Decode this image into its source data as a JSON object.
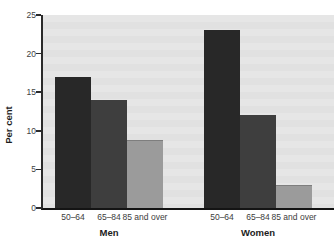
{
  "chart_data": {
    "type": "bar",
    "ylabel": "Per cent",
    "ylim": [
      0,
      25
    ],
    "yticks": [
      0,
      5,
      10,
      15,
      20,
      25
    ],
    "categories": [
      "50–64",
      "65–84",
      "85 and over"
    ],
    "groups": [
      {
        "label": "Men",
        "values": [
          17,
          14,
          8.8
        ]
      },
      {
        "label": "Women",
        "values": [
          23,
          12,
          3
        ]
      }
    ],
    "bar_colors": [
      "#282828",
      "#3e3e3e",
      "#9b9b9b"
    ],
    "bar_edge_color": "#7e7e7e",
    "plot_bg": "#e3e3e3",
    "axis_color": "#2b2b2b",
    "grid": false,
    "legend": "none"
  }
}
